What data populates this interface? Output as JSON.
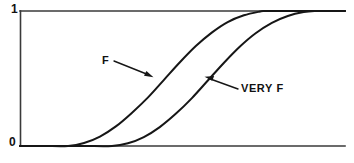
{
  "figure": {
    "title": "",
    "background_color": "#ffffff",
    "line_color": "#161616",
    "axis_color": "#3a3a3a"
  },
  "axis": {
    "y_top_label": "1",
    "y_bottom_label": "0",
    "x_label": "",
    "y_label": ""
  },
  "annotations": {
    "f_label": "F",
    "very_f_label": "VERY F"
  },
  "chart_data": {
    "type": "line",
    "title": "",
    "xlabel": "",
    "ylabel": "",
    "xlim": [
      0,
      1
    ],
    "ylim": [
      0,
      1
    ],
    "grid": false,
    "legend_position": "inline-annotations",
    "tick_labels": {
      "y": [
        "0",
        "1"
      ],
      "x": []
    },
    "annotations": [
      {
        "text": "F",
        "text_xy": [
          0.256,
          0.685
        ],
        "arrow_tip_xy": [
          0.407,
          0.505
        ]
      },
      {
        "text": "VERY F",
        "text_xy": [
          0.683,
          0.455
        ],
        "arrow_tip_xy": [
          0.57,
          0.512
        ]
      }
    ],
    "series": [
      {
        "name": "F",
        "description": "S-shaped membership function, rises from 0 at x=0.148 to 1 at x=0.754",
        "x": [
          0.0,
          0.074,
          0.148,
          0.197,
          0.246,
          0.295,
          0.344,
          0.394,
          0.443,
          0.492,
          0.541,
          0.59,
          0.639,
          0.689,
          0.738,
          0.754,
          0.803,
          0.877,
          1.0
        ],
        "y": [
          0.0,
          0.0,
          0.0,
          0.022,
          0.07,
          0.145,
          0.245,
          0.36,
          0.49,
          0.62,
          0.74,
          0.84,
          0.918,
          0.968,
          0.996,
          1.0,
          1.0,
          1.0,
          1.0
        ]
      },
      {
        "name": "VERY F",
        "description": "Concentration of F (squared), rises from 0 at x=0.283 to 1 at x=0.908",
        "x": [
          0.0,
          0.098,
          0.197,
          0.283,
          0.332,
          0.381,
          0.43,
          0.48,
          0.529,
          0.578,
          0.627,
          0.676,
          0.725,
          0.775,
          0.824,
          0.873,
          0.908,
          0.951,
          1.0
        ],
        "y": [
          0.0,
          0.0,
          0.0,
          0.0,
          0.02,
          0.066,
          0.14,
          0.24,
          0.355,
          0.485,
          0.615,
          0.735,
          0.835,
          0.912,
          0.963,
          0.992,
          1.0,
          1.0,
          1.0
        ]
      }
    ]
  }
}
